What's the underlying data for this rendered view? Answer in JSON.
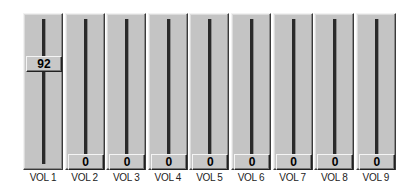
{
  "mixer": {
    "channels": [
      {
        "label": "VOL 1",
        "value": "92",
        "level": 92
      },
      {
        "label": "VOL 2",
        "value": "0",
        "level": 0
      },
      {
        "label": "VOL 3",
        "value": "0",
        "level": 0
      },
      {
        "label": "VOL 4",
        "value": "0",
        "level": 0
      },
      {
        "label": "VOL 5",
        "value": "0",
        "level": 0
      },
      {
        "label": "VOL 6",
        "value": "0",
        "level": 0
      },
      {
        "label": "VOL 7",
        "value": "0",
        "level": 0
      },
      {
        "label": "VOL 8",
        "value": "0",
        "level": 0
      },
      {
        "label": "VOL 9",
        "value": "0",
        "level": 0
      }
    ]
  },
  "colors": {
    "face": "#c4c4c4",
    "track": "#2a2a2a",
    "highlight": "#f2f2f2",
    "shadow": "#3a3a3a"
  }
}
